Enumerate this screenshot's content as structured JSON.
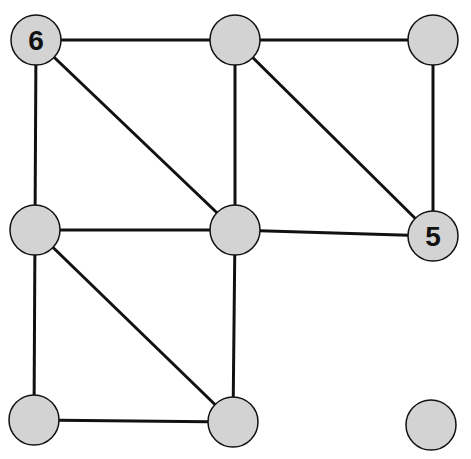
{
  "diagram": {
    "type": "graph",
    "node_fill": "#d3d3d3",
    "stroke": "#111111",
    "nodes": [
      {
        "id": "n1",
        "x": 36,
        "y": 40,
        "label": "6"
      },
      {
        "id": "n2",
        "x": 235,
        "y": 40,
        "label": ""
      },
      {
        "id": "n3",
        "x": 433,
        "y": 40,
        "label": ""
      },
      {
        "id": "n4",
        "x": 35,
        "y": 230,
        "label": ""
      },
      {
        "id": "n5",
        "x": 235,
        "y": 230,
        "label": ""
      },
      {
        "id": "n6",
        "x": 433,
        "y": 236,
        "label": "5"
      },
      {
        "id": "n7",
        "x": 34,
        "y": 420,
        "label": ""
      },
      {
        "id": "n8",
        "x": 233,
        "y": 422,
        "label": ""
      },
      {
        "id": "n9",
        "x": 431,
        "y": 425,
        "label": ""
      }
    ],
    "edges": [
      [
        "n1",
        "n2"
      ],
      [
        "n2",
        "n3"
      ],
      [
        "n1",
        "n4"
      ],
      [
        "n1",
        "n5"
      ],
      [
        "n2",
        "n5"
      ],
      [
        "n2",
        "n6"
      ],
      [
        "n3",
        "n6"
      ],
      [
        "n4",
        "n5"
      ],
      [
        "n5",
        "n6"
      ],
      [
        "n4",
        "n7"
      ],
      [
        "n4",
        "n8"
      ],
      [
        "n5",
        "n8"
      ],
      [
        "n7",
        "n8"
      ]
    ]
  }
}
